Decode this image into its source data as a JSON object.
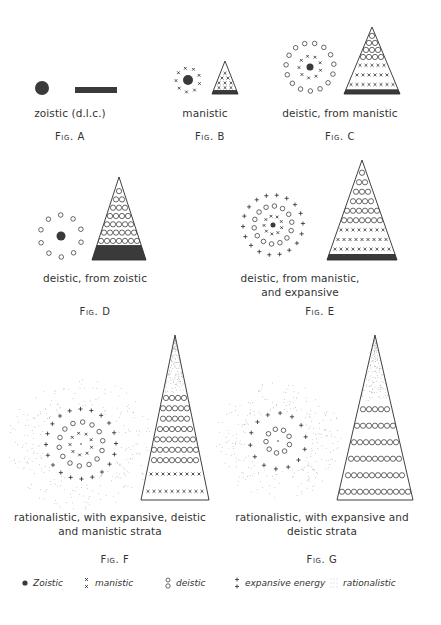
{
  "figures": [
    {
      "id": "A",
      "label": "Fig. A",
      "caption": [
        "zoistic (d.l.c.)"
      ],
      "caption_pos": [
        70,
        106
      ],
      "label_pos": [
        70,
        131
      ],
      "cluster": {
        "center": [
          42,
          88
        ],
        "core_r": 7,
        "rings": []
      },
      "shape": {
        "type": "bar",
        "x": 75,
        "y": 87,
        "w": 42,
        "h": 6
      }
    },
    {
      "id": "B",
      "label": "Fig. B",
      "caption": [
        "manistic"
      ],
      "caption_pos": [
        205,
        106
      ],
      "label_pos": [
        210,
        131
      ],
      "cluster": {
        "center": [
          188,
          80
        ],
        "core_r": 5,
        "rings": [
          {
            "type": "manistic",
            "r": 12,
            "n": 9
          }
        ]
      },
      "shape": {
        "type": "triangle",
        "apex": [
          225,
          61
        ],
        "base_y": 94,
        "half_w": 13,
        "strata": [
          {
            "type": "zoistic",
            "from": 0.88,
            "to": 1.0
          },
          {
            "type": "manistic",
            "from": 0.3,
            "to": 0.88,
            "rows": 4
          }
        ]
      }
    },
    {
      "id": "C",
      "label": "Fig. C",
      "caption": [
        "deistic, from manistic"
      ],
      "caption_pos": [
        340,
        106
      ],
      "label_pos": [
        340,
        131
      ],
      "cluster": {
        "center": [
          310,
          67
        ],
        "core_r": 3.5,
        "rings": [
          {
            "type": "manistic",
            "r": 11,
            "n": 9
          },
          {
            "type": "deistic",
            "r": 24,
            "n": 15
          }
        ]
      },
      "shape": {
        "type": "triangle",
        "apex": [
          372,
          27
        ],
        "base_y": 94,
        "half_w": 28,
        "strata": [
          {
            "type": "zoistic",
            "from": 0.93,
            "to": 1.0
          },
          {
            "type": "manistic",
            "from": 0.5,
            "to": 0.93,
            "rows": 3
          },
          {
            "type": "deistic",
            "from": 0.08,
            "to": 0.5,
            "rows": 4
          }
        ]
      }
    },
    {
      "id": "D",
      "label": "Fig. D",
      "caption": [
        "deistic, from zoistic"
      ],
      "caption_pos": [
        95,
        271
      ],
      "label_pos": [
        95,
        306
      ],
      "cluster": {
        "center": [
          61,
          236
        ],
        "core_r": 4.5,
        "rings": [
          {
            "type": "deistic",
            "r": 21,
            "n": 10
          }
        ]
      },
      "shape": {
        "type": "triangle",
        "apex": [
          119,
          177
        ],
        "base_y": 260,
        "half_w": 27,
        "strata": [
          {
            "type": "zoistic",
            "from": 0.82,
            "to": 1.0
          },
          {
            "type": "deistic",
            "from": 0.12,
            "to": 0.82,
            "rows": 7
          }
        ]
      }
    },
    {
      "id": "E",
      "label": "Fig. E",
      "caption": [
        "deistic, from manistic,",
        "and expansive"
      ],
      "caption_pos": [
        300,
        271
      ],
      "label_pos": [
        320,
        306
      ],
      "cluster": {
        "center": [
          273,
          225
        ],
        "core_r": 2.5,
        "rings": [
          {
            "type": "manistic",
            "r": 9,
            "n": 9
          },
          {
            "type": "deistic",
            "r": 19,
            "n": 14
          },
          {
            "type": "expansive",
            "r": 30,
            "n": 18
          }
        ]
      },
      "shape": {
        "type": "triangle",
        "apex": [
          362,
          160
        ],
        "base_y": 260,
        "half_w": 35,
        "strata": [
          {
            "type": "zoistic",
            "from": 0.94,
            "to": 1.0
          },
          {
            "type": "manistic",
            "from": 0.65,
            "to": 0.94,
            "rows": 3
          },
          {
            "type": "deistic",
            "from": 0.08,
            "to": 0.65,
            "rows": 6
          }
        ]
      }
    },
    {
      "id": "F",
      "label": "Fig. F",
      "caption": [
        "rationalistic, with expansive, deistic",
        "and manistic strata"
      ],
      "caption_pos": [
        110,
        510
      ],
      "label_pos": [
        115,
        554
      ],
      "cluster": {
        "center": [
          81,
          444
        ],
        "core_r": 0.8,
        "rings": [
          {
            "type": "manistic",
            "r": 11,
            "n": 9
          },
          {
            "type": "deistic",
            "r": 22,
            "n": 14
          },
          {
            "type": "expansive",
            "r": 35,
            "n": 20
          }
        ],
        "rationalistic_field": [
          38,
          70
        ]
      },
      "shape": {
        "type": "triangle",
        "apex": [
          175,
          335
        ],
        "base_y": 500,
        "half_w": 34,
        "strata": [
          {
            "type": "manistic",
            "from": 0.79,
            "to": 1.0,
            "rows": 2
          },
          {
            "type": "deistic",
            "from": 0.35,
            "to": 0.79,
            "rows": 7
          },
          {
            "type": "rationalistic",
            "from": 0.0,
            "to": 0.35
          }
        ]
      }
    },
    {
      "id": "G",
      "label": "Fig. G",
      "caption": [
        "rationalistic, with expansive and",
        "deistic strata"
      ],
      "caption_pos": [
        322,
        510
      ],
      "label_pos": [
        322,
        554
      ],
      "cluster": {
        "center": [
          278,
          441
        ],
        "core_r": 0.8,
        "rings": [
          {
            "type": "deistic",
            "r": 12,
            "n": 9
          },
          {
            "type": "expansive",
            "r": 28,
            "n": 14
          }
        ],
        "rationalistic_field": [
          32,
          62
        ]
      },
      "shape": {
        "type": "triangle",
        "apex": [
          375,
          335
        ],
        "base_y": 500,
        "half_w": 38,
        "strata": [
          {
            "type": "deistic",
            "from": 0.4,
            "to": 1.0,
            "rows": 6
          },
          {
            "type": "rationalistic",
            "from": 0.0,
            "to": 0.4
          }
        ]
      }
    }
  ],
  "legend": [
    {
      "symbol": "zoistic",
      "label": "Zoistic",
      "x": 20
    },
    {
      "symbol": "manistic",
      "label": "manistic",
      "x": 82
    },
    {
      "symbol": "deistic",
      "label": "deistic",
      "x": 163
    },
    {
      "symbol": "expansive",
      "label": "expansive energy",
      "x": 232
    },
    {
      "symbol": "rationalistic",
      "label": "rationalistic",
      "x": 330
    }
  ],
  "colors": {
    "ink": "#2b2b2b",
    "stipple": "#9a9a9a",
    "fill": "#3a3a3a"
  }
}
